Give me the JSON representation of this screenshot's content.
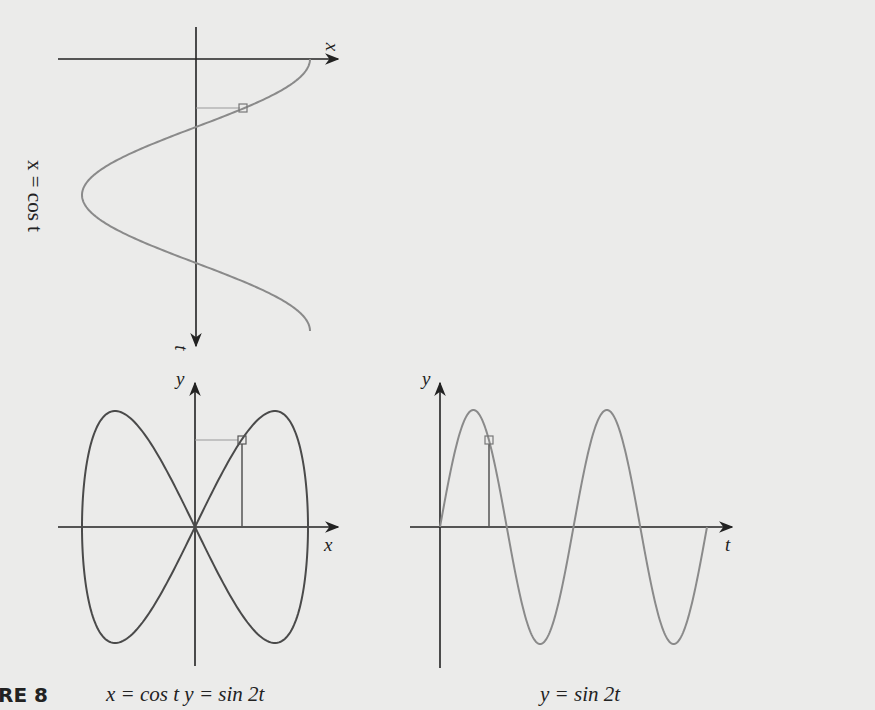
{
  "figure": {
    "label": "RE 8",
    "caption_left": "x = cos t    y = sin 2t",
    "caption_right": "y = sin 2t"
  },
  "colors": {
    "background": "#ebebea",
    "axis": "#222222",
    "curve_gray": "#8a8a8a",
    "curve_dark": "#4a4a4a"
  },
  "top_plot": {
    "rotated_label": "x = cos t",
    "x_axis_label": "x",
    "t_axis_label": "t"
  },
  "left_plot": {
    "x_axis_label": "x",
    "y_axis_label": "y"
  },
  "right_plot": {
    "x_axis_label": "t",
    "y_axis_label": "y"
  },
  "chart_data": [
    {
      "type": "line",
      "title": "x = cos t",
      "xlabel": "x",
      "ylabel": "t",
      "orientation": "t axis pointing downward",
      "t_range": [
        0,
        6.283
      ],
      "x": [
        1,
        0.707,
        0,
        -0.707,
        -1,
        -0.707,
        0,
        0.707,
        1
      ],
      "t": [
        0,
        0.785,
        1.571,
        2.356,
        3.142,
        3.927,
        4.712,
        5.498,
        6.283
      ],
      "marker": {
        "t": 0.785,
        "x": 0.41
      }
    },
    {
      "type": "line",
      "title": "x = cos t, y = sin 2t (parametric)",
      "xlabel": "x",
      "ylabel": "y",
      "x": [
        1,
        0.707,
        0,
        -0.707,
        -1,
        -0.707,
        0,
        0.707,
        1
      ],
      "y": [
        0,
        1,
        0,
        -1,
        0,
        1,
        0,
        -1,
        0
      ],
      "marker": {
        "x": 0.41,
        "y": 0.75
      }
    },
    {
      "type": "line",
      "title": "y = sin 2t",
      "xlabel": "t",
      "ylabel": "y",
      "t_range": [
        0,
        6.283
      ],
      "t": [
        0,
        0.785,
        1.571,
        2.356,
        3.142,
        3.927,
        4.712,
        5.498,
        6.283
      ],
      "y": [
        0,
        1,
        0,
        -1,
        0,
        1,
        0,
        -1,
        0
      ],
      "marker": {
        "t": 1.15,
        "y": 0.75
      }
    }
  ]
}
